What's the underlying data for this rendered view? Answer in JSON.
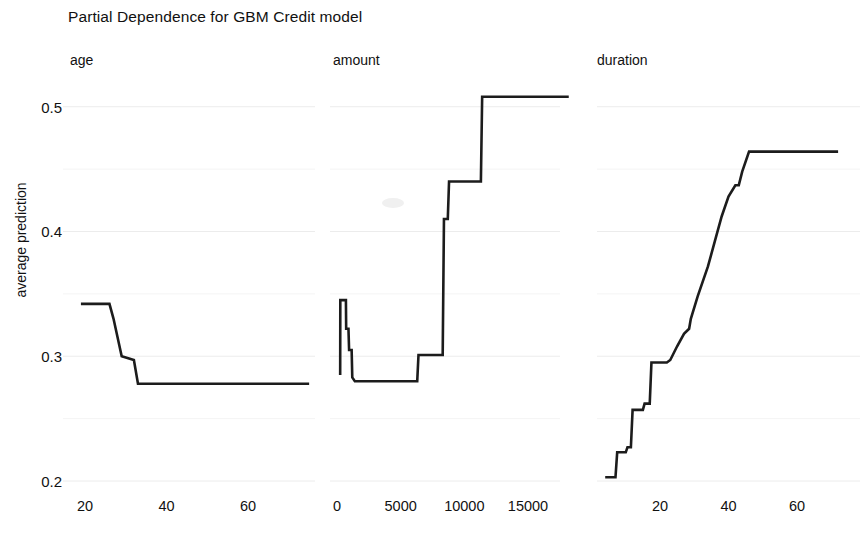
{
  "chart_data": {
    "type": "line",
    "title": "Partial Dependence for GBM Credit model",
    "ylabel": "average prediction",
    "xlabel": "",
    "ylim": [
      0.2,
      0.515
    ],
    "y_ticks": [
      0.5,
      0.4,
      0.3,
      0.2
    ],
    "y_tick_labels": [
      "0.5",
      "0.4",
      "0.3",
      "0.2"
    ],
    "y_minor_gridlines": [
      0.45,
      0.35,
      0.25
    ],
    "grid": true,
    "legend": "none",
    "panels": [
      {
        "name": "age",
        "label": "age",
        "xlim": [
          18,
          75
        ],
        "x_ticks": [
          20,
          40,
          60
        ],
        "x_tick_labels": [
          "20",
          "40",
          "60"
        ],
        "x": [
          19,
          26,
          27,
          29,
          31,
          32,
          33,
          75
        ],
        "y": [
          0.342,
          0.342,
          0.33,
          0.3,
          0.298,
          0.297,
          0.278,
          0.278
        ]
      },
      {
        "name": "amount",
        "label": "amount",
        "xlim": [
          0,
          18500
        ],
        "x_ticks": [
          0,
          5000,
          10000,
          15000
        ],
        "x_tick_labels": [
          "0",
          "5000",
          "10000",
          "15000"
        ],
        "x": [
          250,
          260,
          700,
          720,
          900,
          950,
          1150,
          1200,
          1400,
          6300,
          6400,
          8300,
          8400,
          8700,
          8800,
          11300,
          11400,
          18200
        ],
        "y": [
          0.285,
          0.345,
          0.345,
          0.322,
          0.322,
          0.305,
          0.305,
          0.283,
          0.28,
          0.28,
          0.301,
          0.301,
          0.41,
          0.41,
          0.44,
          0.44,
          0.508,
          0.508
        ]
      },
      {
        "name": "duration",
        "label": "duration",
        "xlim": [
          4,
          72
        ],
        "x_ticks": [
          20,
          40,
          60
        ],
        "x_tick_labels": [
          "20",
          "40",
          "60"
        ],
        "x": [
          4,
          7,
          7.5,
          10,
          10.5,
          11.5,
          12,
          15,
          15.5,
          17,
          17.5,
          22,
          23,
          25,
          27,
          28.5,
          29,
          31,
          34,
          36,
          38,
          40,
          42,
          43,
          44,
          46,
          47,
          72
        ],
        "y": [
          0.203,
          0.203,
          0.223,
          0.223,
          0.227,
          0.227,
          0.257,
          0.257,
          0.262,
          0.262,
          0.295,
          0.295,
          0.297,
          0.308,
          0.318,
          0.322,
          0.33,
          0.348,
          0.372,
          0.392,
          0.412,
          0.428,
          0.437,
          0.437,
          0.448,
          0.464,
          0.464,
          0.464
        ]
      }
    ]
  }
}
